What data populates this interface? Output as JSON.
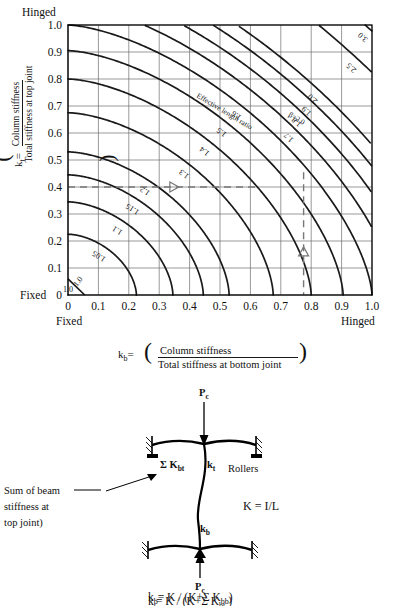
{
  "chart_data": {
    "type": "line",
    "title": "",
    "xlabel_parts": {
      "symbol": "k",
      "subscript": "b",
      "equals": "=",
      "numerator": "Column stiffness",
      "denominator": "Total stiffness at bottom joint"
    },
    "ylabel_parts": {
      "symbol": "k",
      "subscript": "t",
      "equals": "=",
      "numerator": "Column stiffness",
      "denominator": "Total stiffness at top joint"
    },
    "xlim": [
      0,
      1.0
    ],
    "ylim": [
      0,
      1.0
    ],
    "grid": true,
    "x_ticks": [
      "0",
      "0.1",
      "0.2",
      "0.3",
      "0.4",
      "0.5",
      "0.6",
      "0.7",
      "0.8",
      "0.9",
      "1.0"
    ],
    "y_ticks": [
      "0",
      "0.1",
      "0.2",
      "0.3",
      "0.4",
      "0.5",
      "0.6",
      "0.7",
      "0.8",
      "0.9",
      "1.0"
    ],
    "x_ticks_values": [
      0,
      0.1,
      0.2,
      0.3,
      0.4,
      0.5,
      0.6,
      0.7,
      0.8,
      0.9,
      1.0
    ],
    "y_ticks_values": [
      0,
      0.1,
      0.2,
      0.3,
      0.4,
      0.5,
      0.6,
      0.7,
      0.8,
      0.9,
      1.0
    ],
    "axis_end_labels": {
      "y_top": "Hinged",
      "y_bottom": "Fixed",
      "x_left": "Fixed",
      "x_right": "Hinged"
    },
    "annotation": "Effective length ratio",
    "beta_label": "β=2.0",
    "contours": [
      {
        "label": "1.0",
        "beta": 1.0
      },
      {
        "label": "1.05",
        "beta": 1.05
      },
      {
        "label": "1.1",
        "beta": 1.1
      },
      {
        "label": "1.15",
        "beta": 1.15
      },
      {
        "label": "1.2",
        "beta": 1.2
      },
      {
        "label": "1.3",
        "beta": 1.3
      },
      {
        "label": "1.4",
        "beta": 1.4
      },
      {
        "label": "1.5",
        "beta": 1.5
      },
      {
        "label": "1.6",
        "beta": 1.6
      },
      {
        "label": "1.7",
        "beta": 1.7
      },
      {
        "label": "1.8",
        "beta": 1.8
      },
      {
        "label": "1.9",
        "beta": 1.9
      },
      {
        "label": "2.0",
        "beta": 2.0
      },
      {
        "label": "2.5",
        "beta": 2.5
      },
      {
        "label": "3.0",
        "beta": 3.0
      },
      {
        "label": "4.0",
        "beta": 4.0
      },
      {
        "label": "5.0",
        "beta": 5.0
      },
      {
        "label": "∞",
        "beta": 100
      }
    ],
    "construction_lines": [
      {
        "orientation": "horizontal",
        "value": 0.4,
        "style": "dashed",
        "arrow": "right"
      },
      {
        "orientation": "vertical",
        "value": 0.775,
        "style": "dashed",
        "arrow": "up"
      }
    ]
  },
  "diagram": {
    "load_top": {
      "symbol": "P",
      "sub": "c"
    },
    "load_bottom": {
      "symbol": "P",
      "sub": "c"
    },
    "beam_sum_top": {
      "sigma": "Σ",
      "symbol": "K",
      "sub": "bt"
    },
    "kt": {
      "symbol": "k",
      "sub": "t"
    },
    "kb": {
      "symbol": "k",
      "sub": "b"
    },
    "rollers_label": "Rollers",
    "stiffness_def": "K = I/L",
    "callout_line1": "Sum of beam",
    "callout_line2": "stiffness at",
    "callout_line3": "top joint)",
    "formula_kt": {
      "symbol": "k",
      "sub": "t",
      "body": "= K / (K+Σ K",
      "body_sub": "bt",
      "tail": " )"
    },
    "formula_kb": {
      "symbol": "k",
      "sub": "b",
      "body": "= K / (K+Σ K",
      "body_sub": "bb",
      "tail": ")"
    }
  },
  "colors": {
    "curve": "#1a1a1a",
    "grid": "#6f6f6f",
    "axis": "#000000",
    "dash": "#777777",
    "background": "#ffffff"
  }
}
